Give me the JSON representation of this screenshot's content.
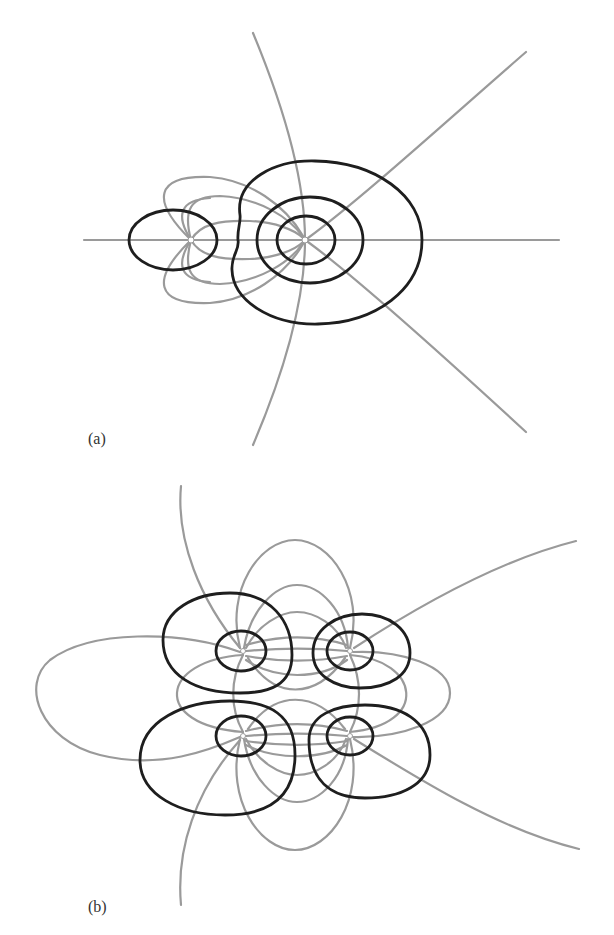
{
  "figure": {
    "panels": [
      {
        "id": "a",
        "label": "(a)",
        "description": "Field lines (gray) and equipotentials (black) for two unequal point charges on a horizontal axis",
        "charges": [
          {
            "name": "small-charge",
            "x": 191,
            "y": 240
          },
          {
            "name": "large-charge",
            "x": 305,
            "y": 240
          }
        ]
      },
      {
        "id": "b",
        "label": "(b)",
        "description": "Field lines (gray) and equipotentials (black) for four point charges arranged in a square",
        "charges": [
          {
            "name": "charge-top-left",
            "x": 243,
            "y": 651
          },
          {
            "name": "charge-top-right",
            "x": 350,
            "y": 651
          },
          {
            "name": "charge-bottom-left",
            "x": 243,
            "y": 736
          },
          {
            "name": "charge-bottom-right",
            "x": 350,
            "y": 736
          }
        ]
      }
    ],
    "colors": {
      "field_line": "#9a9a9a",
      "equipotential": "#1e1e1e",
      "background": "#ffffff"
    }
  }
}
